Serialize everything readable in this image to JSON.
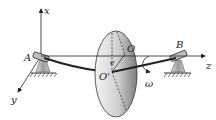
{
  "figure": {
    "labels": {
      "axis_x": "x",
      "axis_y": "y",
      "axis_z": "z",
      "bearing_a": "A",
      "bearing_b": "B",
      "origin": "O",
      "disk_center": "O'",
      "eccentricity": "e",
      "angular_velocity": "ω"
    },
    "colors": {
      "line": "#222222",
      "disk_light": "#f2f2f2",
      "disk_dark": "#8a8a8a",
      "support": "#9a9a9a"
    }
  }
}
